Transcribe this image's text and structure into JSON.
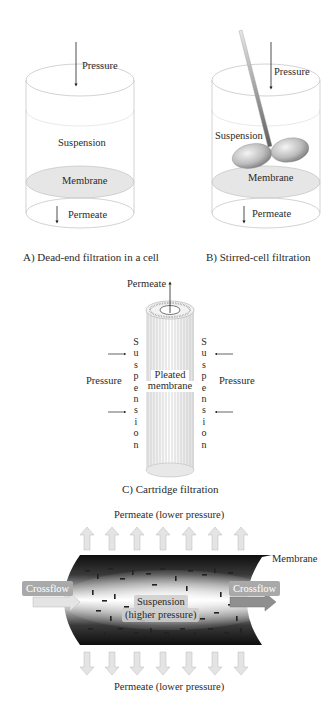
{
  "panels": {
    "a": {
      "caption": "A) Dead-end filtration in a cell",
      "labels": {
        "pressure": "Pressure",
        "suspension": "Suspension",
        "membrane": "Membrane",
        "permeate": "Permeate"
      }
    },
    "b": {
      "caption": "B) Stirred-cell filtration",
      "labels": {
        "pressure": "Pressure",
        "suspension": "Suspension",
        "membrane": "Membrane",
        "permeate": "Permeate"
      }
    },
    "c": {
      "caption": "C) Cartridge filtration",
      "labels": {
        "permeate": "Permeate",
        "pressure_left": "Pressure",
        "pressure_right": "Pressure",
        "suspension_left": "S u s p e n s i o n",
        "suspension_right": "S u s p e n s i o n",
        "membrane_line1": "Pleated",
        "membrane_line2": "membrane"
      }
    },
    "d": {
      "labels": {
        "permeate_top": "Permeate (lower pressure)",
        "permeate_bottom": "Permeate (lower pressure)",
        "membrane": "Membrane",
        "crossflow_in": "Crossflow",
        "crossflow_out": "Crossflow",
        "suspension_line1": "Suspension",
        "suspension_line2": "(higher pressure)"
      },
      "arrow_count_top": 7,
      "arrow_count_bottom": 7
    }
  },
  "colors": {
    "outline": "#c8c8c8",
    "membrane_fill": "#e6e6e6",
    "stirrer": "#9a9a9a",
    "tube_dark": "#111111",
    "arrow_fill": "#e4e4e4",
    "crossflow_tag": "#a9a9a9"
  }
}
